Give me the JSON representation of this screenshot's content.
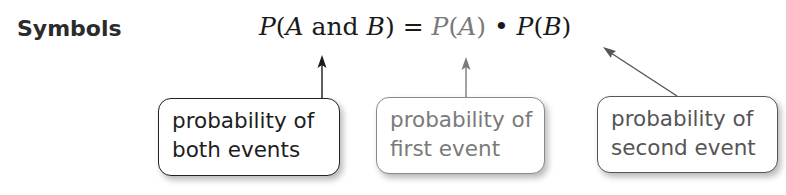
{
  "heading": "Symbols",
  "formula": {
    "lhs_p": "P",
    "lhs_open": "(",
    "lhs_a": "A",
    "lhs_and": " and ",
    "lhs_b": "B",
    "lhs_close": ")",
    "equals": " = ",
    "rhs1": "P(A)",
    "rhs1_p": "P",
    "rhs1_arg": "A",
    "dot": " • ",
    "rhs2_p": "P",
    "rhs2_arg": "B"
  },
  "labels": [
    {
      "line1": "probability of",
      "line2": "both events",
      "target": "P(A and B)",
      "color": "#1d1d1d"
    },
    {
      "line1": "probability of",
      "line2": "first event",
      "target": "P(A)",
      "color": "#7a7a7a"
    },
    {
      "line1": "probability of",
      "line2": "second event",
      "target": "P(B)",
      "color": "#555555"
    }
  ]
}
